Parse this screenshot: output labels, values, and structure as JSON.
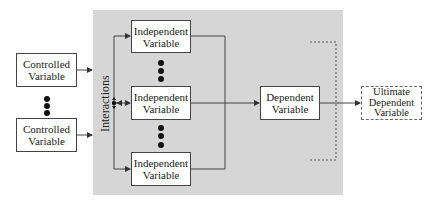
{
  "diagram": {
    "controlled": [
      {
        "label_line1": "Controlled",
        "label_line2": "Variable"
      },
      {
        "label_line1": "Controlled",
        "label_line2": "Variable"
      }
    ],
    "independent": [
      {
        "label_line1": "Independent",
        "label_line2": "Variable"
      },
      {
        "label_line1": "Independent",
        "label_line2": "Variable"
      },
      {
        "label_line1": "Independent",
        "label_line2": "Variable"
      }
    ],
    "interactions_label": "Interactions",
    "dependent": {
      "label_line1": "Dependent",
      "label_line2": "Variable"
    },
    "ultimate": {
      "label_line1": "Ultimate",
      "label_line2": "Dependent",
      "label_line3": "Variable"
    },
    "colors": {
      "panel": "#d6d6d6",
      "line": "#444444"
    }
  }
}
